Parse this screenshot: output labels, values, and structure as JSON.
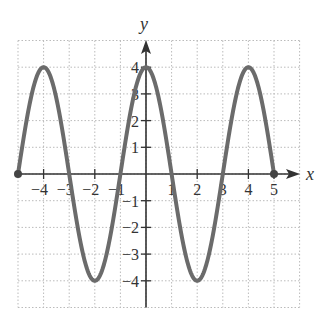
{
  "chart_data": {
    "type": "line",
    "title": "",
    "xlabel": "x",
    "ylabel": "y",
    "xlim": [
      -5,
      6
    ],
    "ylim": [
      -5,
      5
    ],
    "grid": true,
    "x_ticks": [
      "-4",
      "-3",
      "-2",
      "-1",
      "1",
      "2",
      "3",
      "4",
      "5"
    ],
    "y_ticks": [
      "4",
      "3",
      "2",
      "1",
      "-1",
      "-2",
      "-3",
      "-4"
    ],
    "function": "y = 4cos((pi/2)x)",
    "domain": [
      -5,
      5
    ],
    "endpoints": [
      {
        "x": -5,
        "y": 0,
        "closed": true
      },
      {
        "x": 5,
        "y": 0,
        "closed": true
      }
    ],
    "series": [
      {
        "name": "curve",
        "x": [
          -5,
          -4,
          -3,
          -2,
          -1,
          0,
          1,
          2,
          3,
          4,
          5
        ],
        "values": [
          0,
          4,
          0,
          -4,
          0,
          4,
          0,
          -4,
          0,
          4,
          0
        ]
      }
    ],
    "colors": {
      "curve": "#6b6b6b",
      "axis": "#333333",
      "grid": "#bbbbbb"
    }
  }
}
